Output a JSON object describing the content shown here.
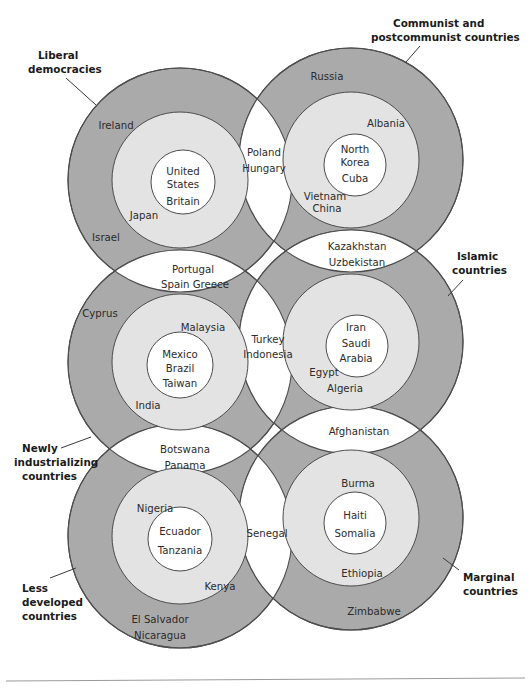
{
  "figure": {
    "colors": {
      "outer_ring": "#aaaaaa",
      "middle_ring": "#e3e3e3",
      "inner_core": "#ffffff",
      "overlap": "#ffffff",
      "stroke": "#4d4d4d",
      "text": "#2b2b2b",
      "background": "#ffffff"
    }
  },
  "callouts": [
    {
      "id": "liberal-democracies",
      "line1": "Liberal",
      "line2": "democracies",
      "line3": ""
    },
    {
      "id": "communist",
      "line1": "Communist and",
      "line2": "postcommunist countries",
      "line3": ""
    },
    {
      "id": "islamic",
      "line1": "Islamic",
      "line2": "countries",
      "line3": ""
    },
    {
      "id": "newly-industrializing",
      "line1": "Newly",
      "line2": "industrializing",
      "line3": "countries"
    },
    {
      "id": "less-developed",
      "line1": "Less",
      "line2": "developed",
      "line3": "countries"
    },
    {
      "id": "marginal",
      "line1": "Marginal",
      "line2": "countries",
      "line3": ""
    }
  ],
  "circles": {
    "liberal_democracies": {
      "name": "Liberal democracies",
      "outer_labels": [
        "Ireland",
        "Israel"
      ],
      "middle_labels": [
        "Japan"
      ],
      "inner_labels": [
        "United",
        "States",
        "Britain"
      ]
    },
    "communist": {
      "name": "Communist and postcommunist countries",
      "outer_labels": [
        "Russia"
      ],
      "middle_labels": [
        "Albania",
        "Vietnam",
        "China"
      ],
      "inner_labels": [
        "North",
        "Korea",
        "Cuba"
      ]
    },
    "newly_industrializing": {
      "name": "Newly industrializing countries",
      "outer_labels": [
        "Cyprus"
      ],
      "middle_labels": [
        "Malaysia",
        "India"
      ],
      "inner_labels": [
        "Mexico",
        "Brazil",
        "Taiwan"
      ]
    },
    "islamic": {
      "name": "Islamic countries",
      "outer_labels": [],
      "middle_labels": [
        "Egypt",
        "Algeria"
      ],
      "inner_labels": [
        "Iran",
        "Saudi",
        "Arabia"
      ]
    },
    "less_developed": {
      "name": "Less developed countries",
      "outer_labels": [
        "El Salvador",
        "Nicaragua"
      ],
      "middle_labels": [
        "Nigeria",
        "Kenya"
      ],
      "inner_labels": [
        "Ecuador",
        "Tanzania"
      ]
    },
    "marginal": {
      "name": "Marginal countries",
      "outer_labels": [
        "Zimbabwe"
      ],
      "middle_labels": [
        "Burma",
        "Ethiopia"
      ],
      "inner_labels": [
        "Haiti",
        "Somalia"
      ]
    }
  },
  "overlaps": {
    "liberal_communist": {
      "id": "poland-hungary",
      "labels": [
        "Poland",
        "Hungary"
      ]
    },
    "liberal_newly": {
      "id": "portugal-spain-greece",
      "labels": [
        "Portugal",
        "Spain   Greece"
      ]
    },
    "communist_islamic": {
      "id": "kazakhstan-uzbekistan",
      "labels": [
        "Kazakhstan",
        "Uzbekistan"
      ]
    },
    "newly_islamic": {
      "id": "turkey-indonesia",
      "labels": [
        "Turkey",
        "Indonesia"
      ]
    },
    "newly_less_developed": {
      "id": "botswana-panama",
      "labels": [
        "Botswana",
        "Panama"
      ]
    },
    "islamic_marginal": {
      "id": "afghanistan",
      "labels": [
        "Afghanistan"
      ]
    },
    "less_developed_marginal": {
      "id": "senegal",
      "labels": [
        "Senegal"
      ]
    }
  },
  "label_text": {
    "ireland": "Ireland",
    "israel": "Israel",
    "japan": "Japan",
    "united": "United",
    "states": "States",
    "britain": "Britain",
    "russia": "Russia",
    "albania": "Albania",
    "vietnam": "Vietnam",
    "china": "China",
    "north": "North",
    "korea": "Korea",
    "cuba": "Cuba",
    "poland": "Poland",
    "hungary": "Hungary",
    "portugal": "Portugal",
    "spain_greece": "Spain   Greece",
    "kazakhstan": "Kazakhstan",
    "uzbekistan": "Uzbekistan",
    "cyprus": "Cyprus",
    "malaysia": "Malaysia",
    "india": "India",
    "mexico": "Mexico",
    "brazil": "Brazil",
    "taiwan": "Taiwan",
    "turkey": "Turkey",
    "indonesia": "Indonesia",
    "iran": "Iran",
    "saudi": "Saudi",
    "arabia": "Arabia",
    "egypt": "Egypt",
    "algeria": "Algeria",
    "afghanistan": "Afghanistan",
    "botswana": "Botswana",
    "panama": "Panama",
    "nigeria": "Nigeria",
    "ecuador": "Ecuador",
    "tanzania": "Tanzania",
    "kenya": "Kenya",
    "el_salvador": "El Salvador",
    "nicaragua": "Nicaragua",
    "senegal": "Senegal",
    "burma": "Burma",
    "haiti": "Haiti",
    "somalia": "Somalia",
    "ethiopia": "Ethiopia",
    "zimbabwe": "Zimbabwe",
    "callout_liberal_1": "Liberal",
    "callout_liberal_2": "democracies",
    "callout_communist_1": "Communist and",
    "callout_communist_2": "postcommunist countries",
    "callout_islamic_1": "Islamic",
    "callout_islamic_2": "countries",
    "callout_newly_1": "Newly",
    "callout_newly_2": "industrializing",
    "callout_newly_3": "countries",
    "callout_less_1": "Less",
    "callout_less_2": "developed",
    "callout_less_3": "countries",
    "callout_marginal_1": "Marginal",
    "callout_marginal_2": "countries"
  }
}
